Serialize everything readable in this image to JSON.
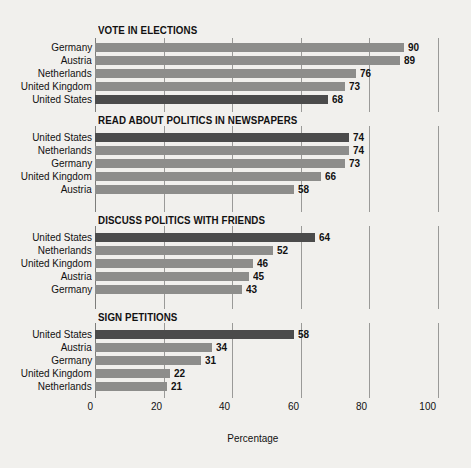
{
  "chart_data": {
    "type": "bar",
    "orientation": "horizontal",
    "title": "",
    "xlabel": "Percentage",
    "ylabel": "",
    "xlim": [
      0,
      100
    ],
    "xticks": [
      0,
      20,
      40,
      60,
      80,
      100
    ],
    "xtick_labels": [
      "0",
      "20",
      "40",
      "60",
      "80",
      "100"
    ],
    "grid": true,
    "legend": "none",
    "highlight_category": "United States",
    "colors": {
      "background": "#f1f0ed",
      "bar": "#8d8d8b",
      "bar_highlight": "#4b4b4b",
      "gridline": "#9a9a98",
      "text": "#111111"
    },
    "panels": [
      {
        "title": "VOTE IN ELECTIONS",
        "categories": [
          "Germany",
          "Austria",
          "Netherlands",
          "United Kingdom",
          "United States"
        ],
        "values": [
          90,
          89,
          76,
          73,
          68
        ]
      },
      {
        "title": "READ ABOUT POLITICS IN NEWSPAPERS",
        "categories": [
          "United States",
          "Netherlands",
          "Germany",
          "United Kingdom",
          "Austria"
        ],
        "values": [
          74,
          74,
          73,
          66,
          58
        ]
      },
      {
        "title": "DISCUSS POLITICS WITH FRIENDS",
        "categories": [
          "United States",
          "Netherlands",
          "United Kingdom",
          "Austria",
          "Germany"
        ],
        "values": [
          64,
          52,
          46,
          45,
          43
        ]
      },
      {
        "title": "SIGN PETITIONS",
        "categories": [
          "United States",
          "Austria",
          "Germany",
          "United Kingdom",
          "Netherlands"
        ],
        "values": [
          58,
          34,
          31,
          22,
          21
        ]
      }
    ]
  }
}
